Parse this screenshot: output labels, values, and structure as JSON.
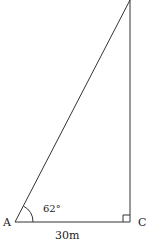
{
  "diagram": {
    "type": "right-triangle",
    "vertices": {
      "A": {
        "label": "A"
      },
      "C": {
        "label": "C"
      },
      "top": {
        "label": ""
      }
    },
    "angle_A": "62°",
    "base_length": "30m",
    "right_angle_at": "C",
    "stroke_color": "#333333"
  }
}
